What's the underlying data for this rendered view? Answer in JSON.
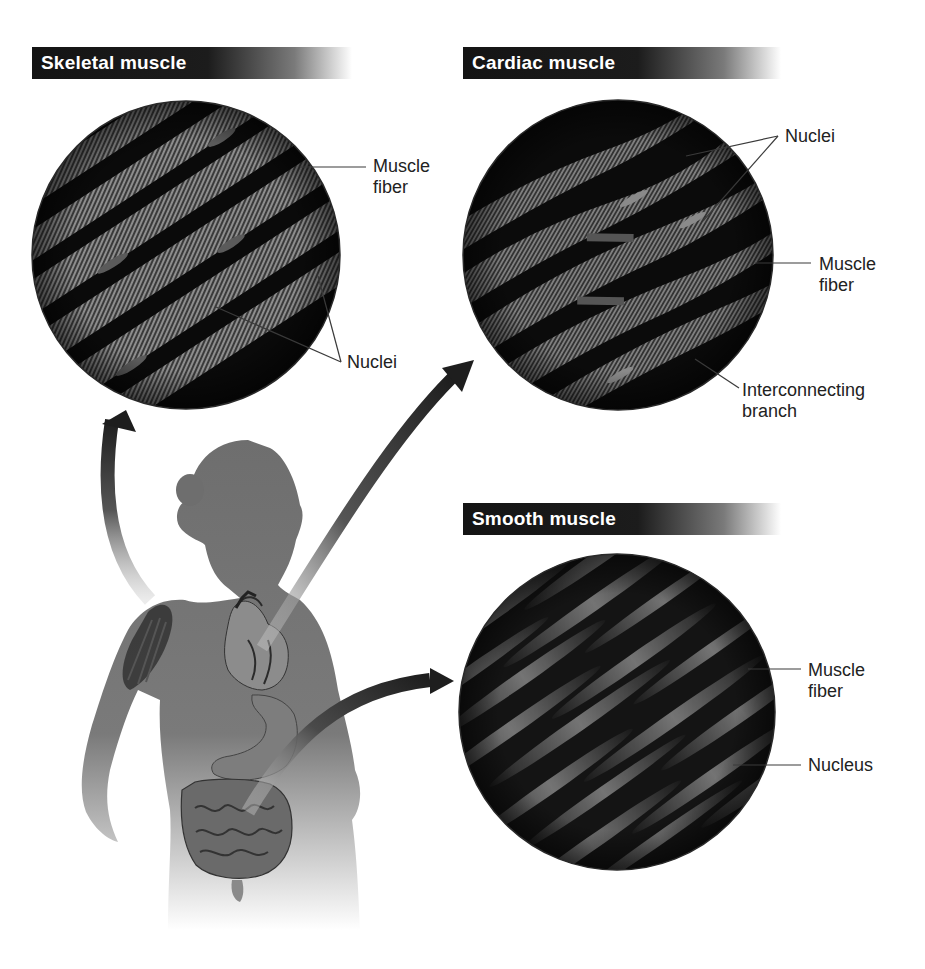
{
  "figure": {
    "panels": [
      {
        "id": "skeletal",
        "title": "Skeletal muscle",
        "labels": [
          "Muscle fiber",
          "Nuclei"
        ],
        "label_lines": {
          "muscle_fiber": [
            "Muscle",
            "fiber"
          ],
          "nuclei": [
            "Nuclei"
          ]
        }
      },
      {
        "id": "cardiac",
        "title": "Cardiac muscle",
        "labels": [
          "Nuclei",
          "Muscle fiber",
          "Interconnecting branch"
        ],
        "label_lines": {
          "nuclei": [
            "Nuclei"
          ],
          "muscle_fiber": [
            "Muscle",
            "fiber"
          ],
          "branch": [
            "Interconnecting",
            "branch"
          ]
        }
      },
      {
        "id": "smooth",
        "title": "Smooth muscle",
        "labels": [
          "Muscle fiber",
          "Nucleus"
        ],
        "label_lines": {
          "muscle_fiber": [
            "Muscle",
            "fiber"
          ],
          "nucleus": [
            "Nucleus"
          ]
        }
      }
    ],
    "body": {
      "figure": "human silhouette (female)",
      "organs": [
        "arm muscle",
        "heart",
        "stomach",
        "intestines"
      ],
      "arrows": [
        {
          "from": "upper arm",
          "to": "Skeletal muscle"
        },
        {
          "from": "heart",
          "to": "Cardiac muscle"
        },
        {
          "from": "intestines",
          "to": "Smooth muscle"
        }
      ]
    },
    "colors": {
      "header_bg": "#141414",
      "header_text": "#ffffff",
      "silhouette": "#6e6e6e",
      "micrograph_bg": "#0e0e0e",
      "fiber_light": "#8a8a8a",
      "label_text": "#222222",
      "leader_line": "#333333"
    }
  }
}
